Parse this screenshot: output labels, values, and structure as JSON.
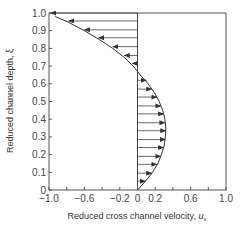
{
  "chart_data": {
    "type": "line",
    "title": "",
    "xlabel": "Reduced cross channel velocity, u_x",
    "xlabel_main": "Reduced cross channel velocity, ",
    "xlabel_symbol": "u",
    "xlabel_sub": "x",
    "ylabel": "Reduced channel depth, ξ",
    "xlim": [
      -1.0,
      1.0
    ],
    "ylim": [
      0,
      1.0
    ],
    "grid": false,
    "legend": null,
    "x_tick_labels": [
      "−1.0",
      "−0.6",
      "−0.2",
      "0",
      "0.2",
      "0.6",
      "1.0"
    ],
    "x_tick_values": [
      -1.0,
      -0.6,
      -0.2,
      0,
      0.2,
      0.6,
      1.0
    ],
    "x_minor_ticks": [
      -0.8,
      -0.4,
      0.4,
      0.8
    ],
    "y_tick_labels": [
      "0",
      "0.1",
      "0.2",
      "0.3",
      "0.4",
      "0.5",
      "0.6",
      "0.7",
      "0.8",
      "0.9",
      "1.0"
    ],
    "y_tick_values": [
      0,
      0.1,
      0.2,
      0.3,
      0.4,
      0.5,
      0.6,
      0.7,
      0.8,
      0.9,
      1.0
    ],
    "series": [
      {
        "name": "velocity profile",
        "xi": [
          0,
          0.05,
          0.1,
          0.15,
          0.2,
          0.25,
          0.3,
          0.35,
          0.4,
          0.45,
          0.5,
          0.55,
          0.6,
          0.65,
          0.67,
          0.7,
          0.75,
          0.8,
          0.85,
          0.9,
          0.95,
          0.98
        ],
        "u": [
          0,
          0.09,
          0.17,
          0.23,
          0.27,
          0.3,
          0.315,
          0.32,
          0.31,
          0.285,
          0.245,
          0.19,
          0.12,
          0.03,
          0,
          -0.05,
          -0.15,
          -0.28,
          -0.43,
          -0.6,
          -0.79,
          -0.93
        ]
      }
    ],
    "arrows": {
      "description": "horizontal velocity arrows from u=0 to profile at regular depth intervals",
      "xi": [
        1.0,
        0.955,
        0.905,
        0.86,
        0.81,
        0.76,
        0.715,
        0.62,
        0.57,
        0.525,
        0.475,
        0.43,
        0.38,
        0.335,
        0.285,
        0.24,
        0.19,
        0.145,
        0.095,
        0.05
      ],
      "u": [
        -0.98,
        -0.78,
        -0.6,
        -0.44,
        -0.28,
        -0.15,
        -0.06,
        0.1,
        0.16,
        0.22,
        0.265,
        0.295,
        0.31,
        0.32,
        0.315,
        0.295,
        0.265,
        0.22,
        0.16,
        0.09
      ]
    }
  }
}
